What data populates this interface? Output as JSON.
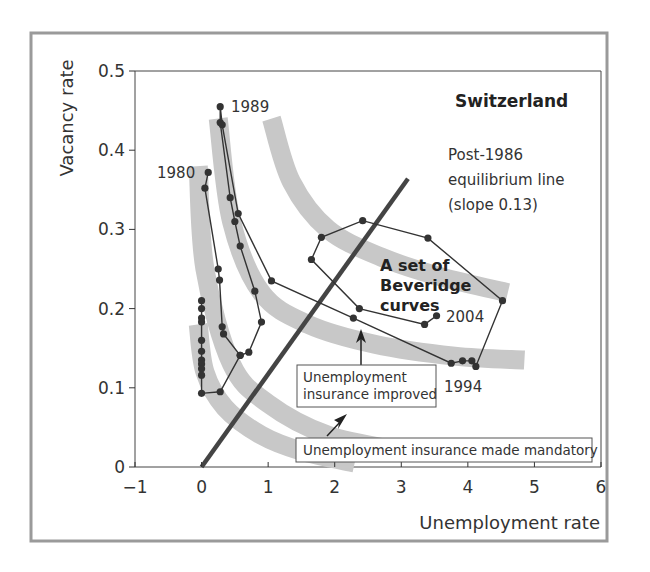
{
  "chart_data": {
    "type": "line",
    "title": "Switzerland",
    "xlabel": "Unemployment rate",
    "ylabel": "Vacancy rate",
    "xlim": [
      -1,
      6
    ],
    "ylim": [
      0,
      0.5
    ],
    "x_ticks": [
      "−1",
      "0",
      "1",
      "2",
      "3",
      "4",
      "5",
      "6"
    ],
    "y_ticks": [
      "0",
      "0.1",
      "0.2",
      "0.3",
      "0.4",
      "0.5"
    ],
    "grid": false,
    "series": [
      {
        "name": "Switzerland (u, v) path 1980–2004",
        "marker": "circle",
        "points": [
          [
            0.1,
            0.372
          ],
          [
            0.05,
            0.352
          ],
          [
            0.25,
            0.25
          ],
          [
            0.27,
            0.236
          ],
          [
            0.31,
            0.177
          ],
          [
            0.33,
            0.168
          ],
          [
            0.58,
            0.141
          ],
          [
            0.71,
            0.145
          ],
          [
            0.9,
            0.183
          ],
          [
            0.8,
            0.222
          ],
          [
            0.58,
            0.279
          ],
          [
            0.5,
            0.31
          ],
          [
            0.43,
            0.34
          ],
          [
            0.28,
            0.435
          ],
          [
            0.28,
            0.455
          ],
          [
            0.31,
            0.432
          ],
          [
            0.55,
            0.32
          ],
          [
            1.05,
            0.235
          ],
          [
            2.28,
            0.188
          ],
          [
            3.75,
            0.131
          ],
          [
            3.92,
            0.134
          ],
          [
            4.06,
            0.134
          ],
          [
            4.12,
            0.127
          ],
          [
            4.52,
            0.21
          ],
          [
            3.4,
            0.289
          ],
          [
            2.42,
            0.311
          ],
          [
            1.8,
            0.29
          ],
          [
            1.65,
            0.262
          ],
          [
            2.37,
            0.2
          ],
          [
            3.35,
            0.18
          ],
          [
            3.53,
            0.191
          ]
        ]
      },
      {
        "name": "Low-unemployment vertical stack (1980s)",
        "marker": "circle",
        "points": [
          [
            0.0,
            0.21
          ],
          [
            0.0,
            0.2
          ],
          [
            0.0,
            0.188
          ],
          [
            0.0,
            0.183
          ],
          [
            0.0,
            0.16
          ],
          [
            0.0,
            0.146
          ],
          [
            0.0,
            0.135
          ],
          [
            0.0,
            0.13
          ],
          [
            0.0,
            0.124
          ],
          [
            0.0,
            0.116
          ],
          [
            0.0,
            0.093
          ],
          [
            0.28,
            0.095
          ],
          [
            0.58,
            0.141
          ]
        ]
      },
      {
        "name": "Post-1986 equilibrium line",
        "style": "thick-line",
        "points": [
          [
            0.0,
            0.0
          ],
          [
            3.1,
            0.364
          ]
        ]
      }
    ],
    "beveridge_curves": [
      {
        "name": "curve-1",
        "points": [
          [
            -0.05,
            0.38
          ],
          [
            0.05,
            0.25
          ],
          [
            0.45,
            0.13
          ],
          [
            1.0,
            0.08
          ],
          [
            1.9,
            0.04
          ],
          [
            3.0,
            0.02
          ]
        ]
      },
      {
        "name": "curve-2",
        "points": [
          [
            0.25,
            0.44
          ],
          [
            0.45,
            0.31
          ],
          [
            0.9,
            0.22
          ],
          [
            1.6,
            0.18
          ],
          [
            2.6,
            0.155
          ],
          [
            3.8,
            0.14
          ],
          [
            4.85,
            0.135
          ]
        ]
      },
      {
        "name": "curve-3",
        "points": [
          [
            1.05,
            0.44
          ],
          [
            1.35,
            0.36
          ],
          [
            1.9,
            0.3
          ],
          [
            2.7,
            0.265
          ],
          [
            3.6,
            0.24
          ],
          [
            4.6,
            0.22
          ]
        ]
      },
      {
        "name": "curve-0",
        "points": [
          [
            -0.05,
            0.18
          ],
          [
            0.05,
            0.12
          ],
          [
            0.35,
            0.075
          ],
          [
            0.9,
            0.04
          ],
          [
            1.5,
            0.02
          ],
          [
            2.3,
            0.005
          ]
        ]
      }
    ],
    "point_labels": [
      {
        "text": "1980",
        "x": -0.35,
        "y": 0.37
      },
      {
        "text": "1989",
        "x": 0.6,
        "y": 0.455
      },
      {
        "text": "1994",
        "x": 4.1,
        "y": 0.095
      },
      {
        "text": "2004",
        "x": 3.9,
        "y": 0.185
      }
    ],
    "annotations": [
      {
        "text": "Post-1986 equilibrium line (slope 0.13)"
      },
      {
        "text": "A set of Beveridge curves"
      },
      {
        "text": "Unemployment insurance improved"
      },
      {
        "text": "Unemployment insurance made mandatory"
      }
    ]
  },
  "labels": {
    "title": "Switzerland",
    "x_axis_title": "Unemployment rate",
    "y_axis_title": "Vacancy rate",
    "x_ticks": [
      "−1",
      "0",
      "1",
      "2",
      "3",
      "4",
      "5",
      "6"
    ],
    "y_ticks": [
      "0",
      "0.1",
      "0.2",
      "0.3",
      "0.4",
      "0.5"
    ],
    "year_1980": "1980",
    "year_1989": "1989",
    "year_1994": "1994",
    "year_2004": "2004",
    "eq_line_1": "Post-1986",
    "eq_line_2": "equilibrium line",
    "eq_line_3": "(slope 0.13)",
    "beveridge_1": "A set of",
    "beveridge_2": "Beveridge",
    "beveridge_3": "curves",
    "ui_improved_1": "Unemployment",
    "ui_improved_2": "insurance improved",
    "ui_mandatory": "Unemployment insurance made mandatory"
  },
  "colors": {
    "frame": "#999999",
    "axis": "#333333",
    "curve_band": "#c8c8c8",
    "data_line": "#333333",
    "marker": "#333333",
    "eq_line": "#444444"
  }
}
